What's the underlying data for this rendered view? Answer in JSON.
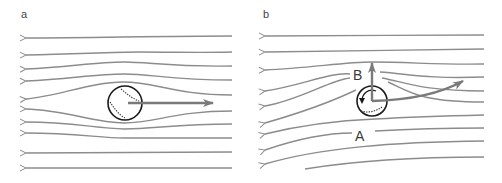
{
  "figure": {
    "panels": [
      {
        "id": "a",
        "label": "a",
        "description": "Non-spinning ball: symmetric streamlines flowing right-to-left around ball, velocity arrow pointing right"
      },
      {
        "id": "b",
        "label": "b",
        "description": "Spinning ball: asymmetric streamlines, upward force arrow and curved trajectory arrow",
        "annotations": {
          "point_b": "B",
          "point_a": "A"
        }
      }
    ],
    "colors": {
      "streamline": "#8c8c8c",
      "arrow": "#7a7a7a",
      "ball_outline": "#1a1a1a",
      "label": "#444444",
      "background": "#ffffff"
    }
  }
}
